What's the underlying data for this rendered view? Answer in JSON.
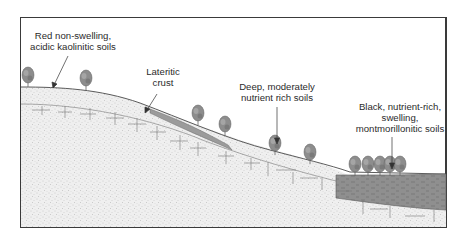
{
  "diagram": {
    "type": "soil-catena-cross-section",
    "labels": [
      {
        "id": "red-soils",
        "lines": [
          "Red non-swelling,",
          "acidic kaolinitic soils"
        ],
        "x": 73,
        "y": 32
      },
      {
        "id": "lateritic-crust",
        "lines": [
          "Lateritic",
          "crust"
        ],
        "x": 163,
        "y": 69
      },
      {
        "id": "deep-soils",
        "lines": [
          "Deep, moderately",
          "nutrient rich soils"
        ],
        "x": 277,
        "y": 81
      },
      {
        "id": "black-soils",
        "lines": [
          "Black, nutrient-rich,",
          "swelling,",
          "montmorillonitic soils"
        ],
        "x": 408,
        "y": 102
      }
    ],
    "colors": {
      "frame": "#3a3a3a",
      "stipple": "#e9e9e9",
      "stipple_dot": "#9a9a9a",
      "crust": "#9c9c9c",
      "black_soil": "#8e8e8e",
      "tree": "#8a8a8a",
      "line": "#555555"
    }
  }
}
